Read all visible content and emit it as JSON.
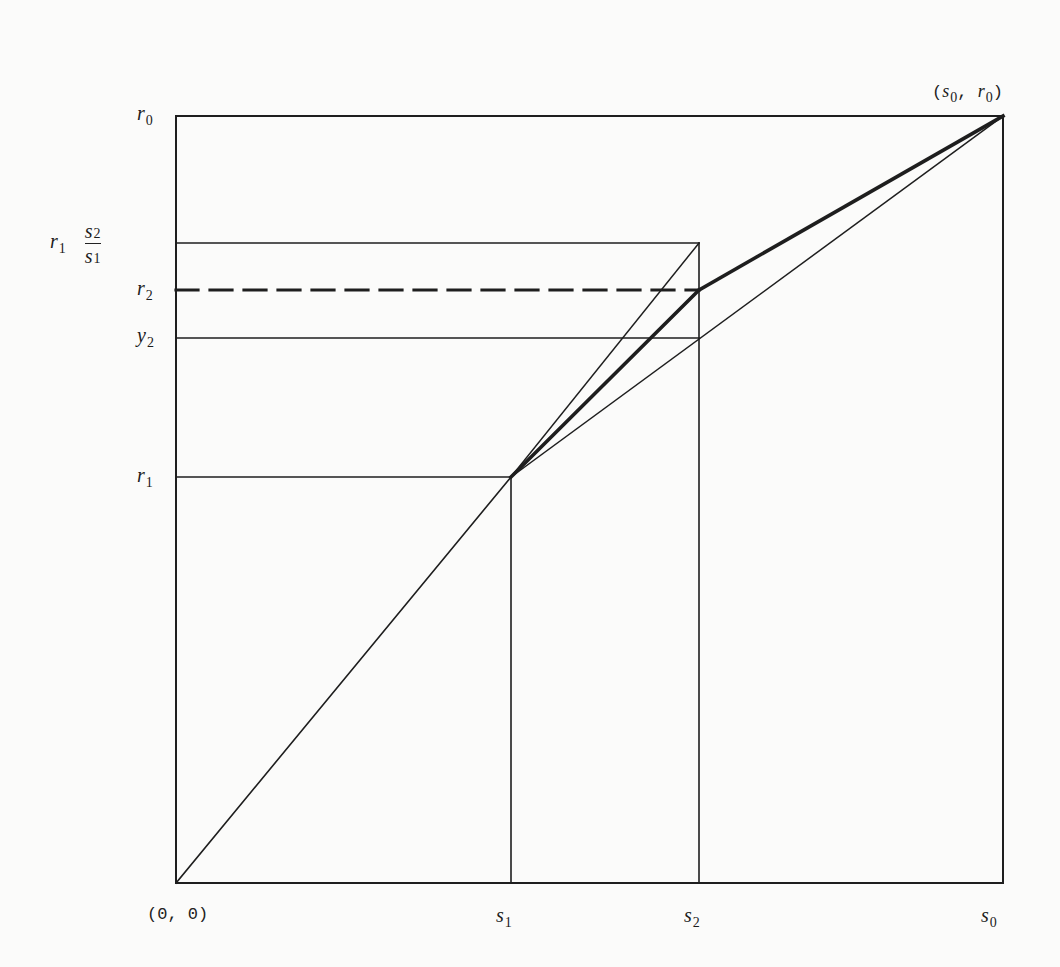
{
  "diagram": {
    "type": "geometric-construction",
    "frame": {
      "left": 176,
      "top": 116,
      "right": 1003,
      "bottom": 883
    },
    "colors": {
      "line": "#1e1e1e",
      "background": "#fbfbfa",
      "label": "#1c1c1c"
    },
    "corner_labels": {
      "origin": "(0, 0)",
      "top_right": {
        "open": "(",
        "s": "s",
        "s_sub": "0",
        "sep": ", ",
        "r": "r",
        "r_sub": "0",
        "close": ")"
      }
    },
    "x_labels": [
      {
        "var": "s",
        "sub": "1",
        "x": 511
      },
      {
        "var": "s",
        "sub": "2",
        "x": 699
      },
      {
        "var": "s",
        "sub": "0",
        "x": 1003
      }
    ],
    "y_labels": [
      {
        "var": "r",
        "sub": "0",
        "y": 116
      },
      {
        "var": "r",
        "sub": "2",
        "y": 290
      },
      {
        "var": "y",
        "sub": "2",
        "y": 338
      },
      {
        "var": "r",
        "sub": "1",
        "y": 477
      }
    ],
    "fraction_label": {
      "prefix_var": "r",
      "prefix_sub": "1",
      "num_var": "s",
      "num_sub": "2",
      "den_var": "s",
      "den_sub": "1",
      "y": 243
    },
    "points": {
      "origin": [
        176,
        883
      ],
      "p1": [
        511,
        477
      ],
      "p_top": [
        699,
        243
      ],
      "p_r2": [
        699,
        290
      ],
      "p_y2": [
        699,
        338
      ],
      "end": [
        1003,
        116
      ]
    },
    "segments": [
      {
        "name": "origin-to-p1",
        "from": "origin",
        "to": "p1",
        "style": "thin"
      },
      {
        "name": "p1-to-ptop",
        "from": "p1",
        "to": "p_top",
        "style": "thin"
      },
      {
        "name": "p1-to-pr2",
        "from": "p1",
        "to": "p_r2",
        "style": "bold"
      },
      {
        "name": "pr2-to-end",
        "from": "p_r2",
        "to": "end",
        "style": "bold"
      },
      {
        "name": "p1-to-end",
        "from": "p1",
        "to": "end",
        "style": "thin"
      }
    ]
  }
}
